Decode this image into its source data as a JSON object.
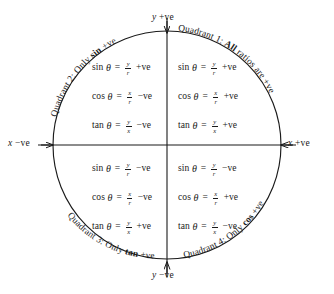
{
  "diagram": {
    "type": "unit-circle-quadrant-signs",
    "stroke_color": "#1a1a1a",
    "background_color": "#ffffff",
    "geometry": {
      "center_x": 167,
      "center_y": 145,
      "radius": 114
    },
    "axes": {
      "y_positive": {
        "var": "y",
        "sign": "+ve",
        "text": "y +ve"
      },
      "y_negative": {
        "var": "y",
        "sign": "−ve",
        "text": "y −ve"
      },
      "x_negative": {
        "var": "x",
        "sign": "−ve",
        "text": "x −ve"
      },
      "x_positive": {
        "var": "x",
        "sign": "+ve",
        "text": "x +ve"
      }
    },
    "quadrants": [
      {
        "id": "quadrant-1",
        "number": "1",
        "arc_label_prefix": "Quadrant 1: ",
        "arc_label_bold": "All",
        "arc_label_suffix": " ratios are +ve",
        "arc_label_full": "Quadrant 1: All ratios are +ve",
        "formulas": [
          {
            "fn": "sin",
            "numerator": "y",
            "denominator": "r",
            "sign": "+ve"
          },
          {
            "fn": "cos",
            "numerator": "x",
            "denominator": "r",
            "sign": "+ve"
          },
          {
            "fn": "tan",
            "numerator": "y",
            "denominator": "x",
            "sign": "+ve"
          }
        ]
      },
      {
        "id": "quadrant-2",
        "number": "2",
        "arc_label_prefix": "Quadrant 2: Only ",
        "arc_label_bold": "sin",
        "arc_label_suffix": " +ve",
        "arc_label_full": "Quadrant 2: Only sin +ve",
        "formulas": [
          {
            "fn": "sin",
            "numerator": "y",
            "denominator": "r",
            "sign": "+ve"
          },
          {
            "fn": "cos",
            "numerator": "x",
            "denominator": "r",
            "sign": "−ve"
          },
          {
            "fn": "tan",
            "numerator": "y",
            "denominator": "x",
            "sign": "−ve"
          }
        ]
      },
      {
        "id": "quadrant-3",
        "number": "3",
        "arc_label_prefix": "Quadrant 3: Only ",
        "arc_label_bold": "tan",
        "arc_label_suffix": " +ve",
        "arc_label_full": "Quadrant 3: Only tan +ve",
        "formulas": [
          {
            "fn": "sin",
            "numerator": "y",
            "denominator": "r",
            "sign": "−ve"
          },
          {
            "fn": "cos",
            "numerator": "x",
            "denominator": "r",
            "sign": "−ve"
          },
          {
            "fn": "tan",
            "numerator": "y",
            "denominator": "x",
            "sign": "+ve"
          }
        ]
      },
      {
        "id": "quadrant-4",
        "number": "4",
        "arc_label_prefix": "Quadrant 4: Only ",
        "arc_label_bold": "cos",
        "arc_label_suffix": " +ve",
        "arc_label_full": "Quadrant 4: Only cos +ve",
        "formulas": [
          {
            "fn": "sin",
            "numerator": "y",
            "denominator": "r",
            "sign": "−ve"
          },
          {
            "fn": "cos",
            "numerator": "x",
            "denominator": "r",
            "sign": "+ve"
          },
          {
            "fn": "tan",
            "numerator": "y",
            "denominator": "x",
            "sign": "−ve"
          }
        ]
      }
    ],
    "symbols": {
      "theta": "θ",
      "equals": "="
    }
  }
}
